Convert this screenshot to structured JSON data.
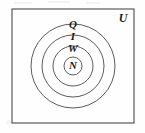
{
  "diagram": {
    "kind": "euler-diagram",
    "stroke_color": "#4a4a4a",
    "text_color": "#1a1a1a",
    "background_color": "#fefefe",
    "universe": {
      "label": "U",
      "shape": "rectangle",
      "x": 12,
      "y": 9,
      "width": 122,
      "height": 114,
      "label_x": 122,
      "label_y": 17
    },
    "sets": [
      {
        "label": "Q",
        "shape": "circle",
        "cx": 73,
        "cy": 66,
        "r": 42,
        "label_x": 73,
        "label_y": 24,
        "level": 1
      },
      {
        "label": "I",
        "shape": "circle",
        "cx": 73,
        "cy": 66,
        "r": 31,
        "label_x": 73,
        "label_y": 36,
        "level": 2
      },
      {
        "label": "W",
        "shape": "circle",
        "cx": 73,
        "cy": 66,
        "r": 20,
        "label_x": 73,
        "label_y": 48,
        "level": 3
      },
      {
        "label": "N",
        "shape": "circle",
        "cx": 73,
        "cy": 66,
        "r": 9,
        "label_x": 73,
        "label_y": 66,
        "level": 4
      }
    ]
  }
}
